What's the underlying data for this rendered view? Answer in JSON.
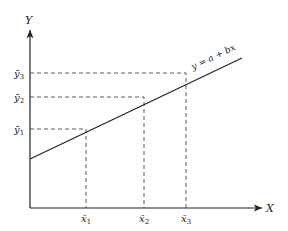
{
  "diagram": {
    "axes": {
      "x_label": "X",
      "y_label": "Y"
    },
    "line_equation": "y = a + bx",
    "points": [
      {
        "x_label": "x̄",
        "x_sub": "1",
        "y_label": "ȳ",
        "y_sub": "1"
      },
      {
        "x_label": "x̄",
        "x_sub": "2",
        "y_label": "ȳ",
        "y_sub": "2"
      },
      {
        "x_label": "x̄",
        "x_sub": "3",
        "y_label": "ȳ",
        "y_sub": "3"
      }
    ],
    "colors": {
      "stroke": "#222222",
      "background": "#ffffff"
    }
  }
}
